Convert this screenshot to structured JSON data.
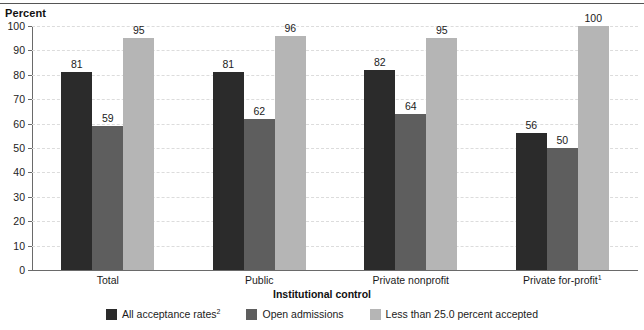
{
  "chart_data": {
    "type": "bar",
    "title": "",
    "subtitle": "",
    "xlabel": "Institutional control",
    "ylabel": "Percent",
    "ylim": [
      0,
      100
    ],
    "ytick_step": 10,
    "ytick_labels": [
      "0",
      "10",
      "20",
      "30",
      "40",
      "50",
      "60",
      "70",
      "80",
      "90",
      "100"
    ],
    "grid": true,
    "grid_axis": "y",
    "legend_position": "bottom",
    "categories": [
      "Total",
      "Public",
      "Private nonprofit",
      "Private for-profit"
    ],
    "category_footnotes": [
      "",
      "",
      "",
      "1"
    ],
    "series": [
      {
        "name": "All acceptance rates",
        "footnote": "2",
        "color": "#2b2b2b",
        "values": [
          81,
          81,
          82,
          56
        ]
      },
      {
        "name": "Open admissions",
        "footnote": "",
        "color": "#5e5e5e",
        "values": [
          59,
          62,
          64,
          50
        ]
      },
      {
        "name": "Less than 25.0 percent accepted",
        "footnote": "",
        "color": "#b5b5b5",
        "values": [
          95,
          96,
          95,
          100
        ]
      }
    ],
    "data_labels": {
      "Total": [
        81,
        59,
        95
      ],
      "Public": [
        81,
        62,
        96
      ],
      "Private nonprofit": [
        82,
        64,
        95
      ],
      "Private for-profit": [
        56,
        50,
        100
      ]
    }
  },
  "axes": {
    "y_title": "Percent",
    "x_title": "Institutional control"
  },
  "legend": {
    "items": [
      {
        "label": "All acceptance rates",
        "sup": "2",
        "color": "#2b2b2b"
      },
      {
        "label": "Open admissions",
        "sup": "",
        "color": "#5e5e5e"
      },
      {
        "label": "Less than 25.0 percent accepted",
        "sup": "",
        "color": "#b5b5b5"
      }
    ]
  },
  "colors": {
    "series_1": "#2b2b2b",
    "series_2": "#5e5e5e",
    "series_3": "#b5b5b5",
    "axis": "#6a6a6a",
    "grid": "#dcdcdc",
    "text": "#1b1b1b",
    "background": "#ffffff"
  }
}
